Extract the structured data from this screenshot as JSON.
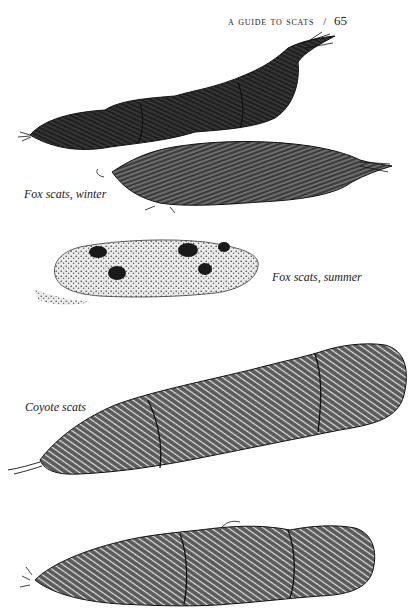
{
  "page": {
    "running_head": "A GUIDE TO SCATS",
    "separator": "/",
    "page_number": "65"
  },
  "figures": [
    {
      "id": "fox-winter",
      "caption": "Fox scats, winter"
    },
    {
      "id": "fox-summer",
      "caption": "Fox scats, summer"
    },
    {
      "id": "coyote",
      "caption": "Coyote scats"
    },
    {
      "id": "unlabeled-bottom",
      "caption": ""
    }
  ],
  "colors": {
    "ink": "#1a1a1a",
    "paper": "#ffffff"
  }
}
